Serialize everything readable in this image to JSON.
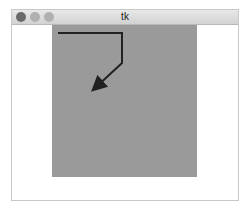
{
  "window": {
    "title": "tk",
    "buttons": [
      "close",
      "minimize",
      "maximize"
    ]
  },
  "canvas": {
    "background": "#9a9a9a",
    "path": {
      "color": "#222222",
      "points": [
        [
          6,
          8
        ],
        [
          70,
          8
        ],
        [
          70,
          38
        ],
        [
          42,
          64
        ]
      ],
      "arrow_end": true
    }
  }
}
